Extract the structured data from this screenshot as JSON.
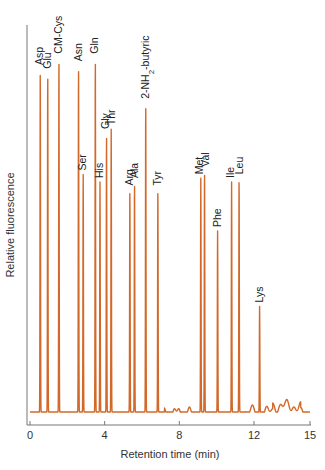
{
  "chart_data": {
    "type": "line",
    "title": "",
    "xlabel": "Retention time (min)",
    "ylabel": "Relative fluorescence",
    "xlim": [
      0,
      15
    ],
    "x_ticks": [
      0,
      4,
      8,
      12,
      15
    ],
    "y_ticks": [],
    "grid": false,
    "legend": null,
    "line_color": "#d2692a",
    "series": [
      {
        "name": "Amino acid chromatogram",
        "peaks": [
          {
            "label": "Asp",
            "x": 0.55,
            "height": 0.91
          },
          {
            "label": "Glu",
            "x": 0.95,
            "height": 0.9
          },
          {
            "label": "CM-Cys",
            "x": 1.55,
            "height": 0.94
          },
          {
            "label": "Asn",
            "x": 2.6,
            "height": 0.92
          },
          {
            "label": "Gln",
            "x": 3.5,
            "height": 0.94
          },
          {
            "label": "Ser",
            "x": 2.85,
            "height": 0.63
          },
          {
            "label": "His",
            "x": 3.75,
            "height": 0.61
          },
          {
            "label": "Gly",
            "x": 4.1,
            "height": 0.74
          },
          {
            "label": "Thr",
            "x": 4.35,
            "height": 0.75
          },
          {
            "label": "Arg",
            "x": 5.35,
            "height": 0.59
          },
          {
            "label": "Ala",
            "x": 5.6,
            "height": 0.61
          },
          {
            "label": "2-NH2-butyric",
            "x": 6.2,
            "height": 0.82
          },
          {
            "label": "Tyr",
            "x": 6.85,
            "height": 0.59
          },
          {
            "label": "Met",
            "x": 9.15,
            "height": 0.62
          },
          {
            "label": "Val",
            "x": 9.35,
            "height": 0.64
          },
          {
            "label": "Phe",
            "x": 10.05,
            "height": 0.48
          },
          {
            "label": "Ile",
            "x": 10.8,
            "height": 0.61
          },
          {
            "label": "Leu",
            "x": 11.2,
            "height": 0.62
          },
          {
            "label": "Lys",
            "x": 12.3,
            "height": 0.28
          }
        ]
      }
    ]
  }
}
